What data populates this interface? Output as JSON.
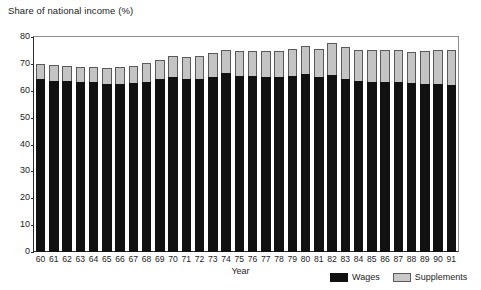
{
  "chart_data": {
    "type": "bar",
    "title": "",
    "ylabel": "Share of national income (%)",
    "xlabel": "Year",
    "ylim": [
      0,
      80
    ],
    "yticks": [
      0,
      10,
      20,
      30,
      40,
      50,
      60,
      70,
      80
    ],
    "grid": false,
    "stacked": true,
    "legend_position": "bottom-right",
    "categories": [
      "60",
      "61",
      "62",
      "63",
      "64",
      "65",
      "66",
      "67",
      "68",
      "69",
      "70",
      "71",
      "72",
      "73",
      "74",
      "75",
      "76",
      "77",
      "78",
      "79",
      "80",
      "81",
      "82",
      "83",
      "84",
      "85",
      "86",
      "87",
      "88",
      "89",
      "90",
      "91"
    ],
    "series": [
      {
        "name": "Wages",
        "color": "#111111",
        "values": [
          64.3,
          63.8,
          63.5,
          63.2,
          63.2,
          62.5,
          62.6,
          63.0,
          63.3,
          64.2,
          65.3,
          64.3,
          64.4,
          65.0,
          66.6,
          65.5,
          65.4,
          65.1,
          65.2,
          65.6,
          66.1,
          65.3,
          65.9,
          64.5,
          63.5,
          63.3,
          63.4,
          63.4,
          62.9,
          62.6,
          62.5,
          62.2
        ]
      },
      {
        "name": "Supplements",
        "color": "#c4c4c4",
        "values": [
          5.7,
          5.8,
          5.7,
          5.8,
          5.8,
          5.9,
          6.1,
          6.3,
          7.1,
          7.2,
          7.6,
          8.1,
          8.5,
          9.0,
          8.6,
          9.4,
          9.4,
          9.6,
          9.5,
          10.0,
          10.4,
          10.4,
          12.0,
          11.9,
          11.5,
          11.7,
          11.9,
          11.6,
          11.7,
          12.3,
          12.8,
          13.0
        ]
      }
    ],
    "totals": [
      70.0,
      69.6,
      69.2,
      69.0,
      69.0,
      68.4,
      68.7,
      69.3,
      70.4,
      71.4,
      72.9,
      72.4,
      72.9,
      74.0,
      75.2,
      74.9,
      74.8,
      74.7,
      74.7,
      75.6,
      76.5,
      75.7,
      77.9,
      76.4,
      75.0,
      75.0,
      75.3,
      75.0,
      74.6,
      74.9,
      75.3,
      75.2
    ],
    "legend": [
      {
        "label": "Wages",
        "swatch": "black-square-icon"
      },
      {
        "label": "Supplements",
        "swatch": "gray-square-icon"
      }
    ]
  }
}
